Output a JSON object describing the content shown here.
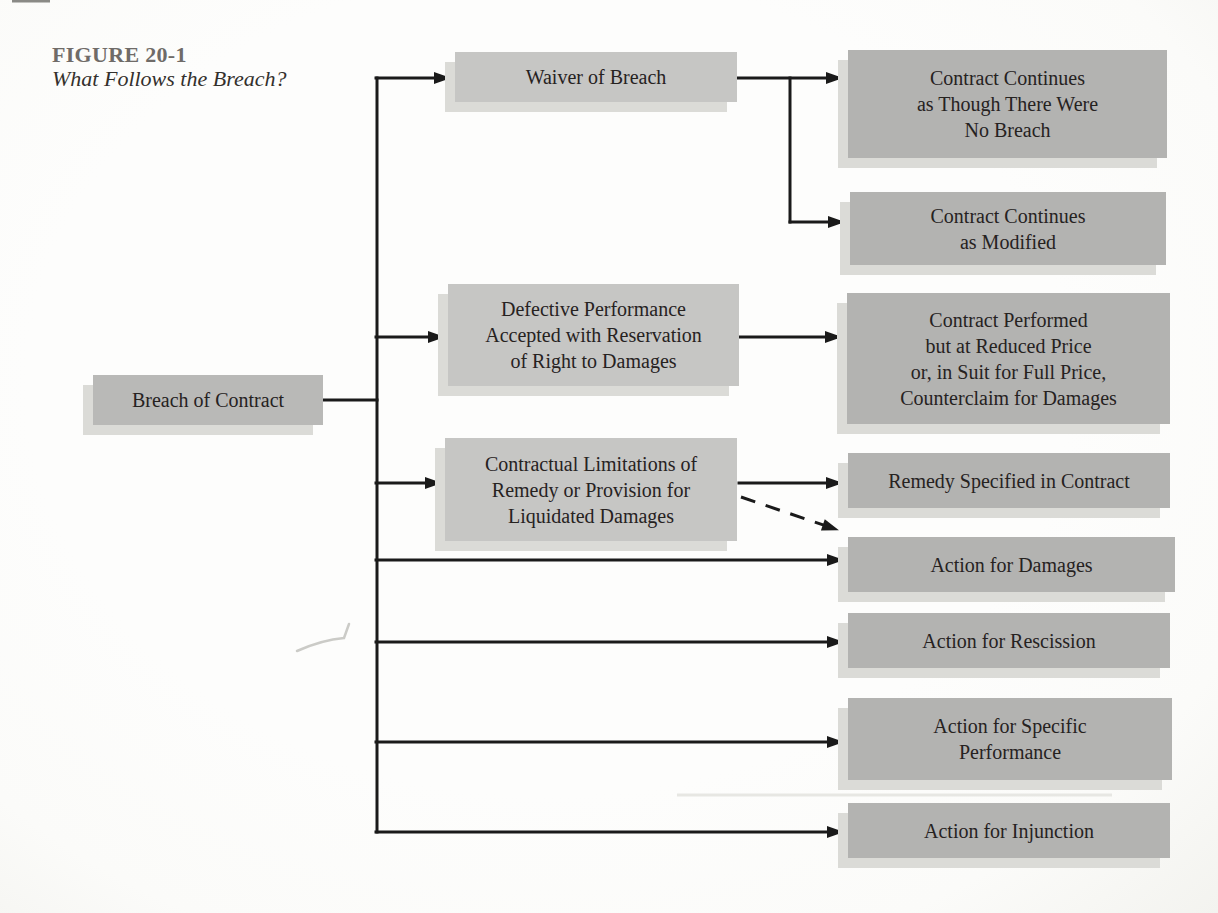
{
  "figure": {
    "label": "FIGURE 20-1",
    "caption": "What Follows the Breach?"
  },
  "colors": {
    "background": "#fbfbf9",
    "line": "#1a1a1a",
    "text": "#26221f",
    "figure_label_color": "#6f6b68",
    "figure_caption_color": "#33302c",
    "box_left_fill": "#b9b9b7",
    "box_mid_fill": "#c6c6c4",
    "box_right_fill": "#b3b3b1",
    "shadow": "#dbdbd7"
  },
  "nodes": {
    "breach": {
      "label": "Breach of Contract"
    },
    "waiver": {
      "label": "Waiver of Breach"
    },
    "defective": {
      "label": "Defective Performance\nAccepted with Reservation\nof Right to Damages"
    },
    "contractual": {
      "label": "Contractual Limitations of\nRemedy or Provision for\nLiquidated Damages"
    },
    "continues_no_breach": {
      "label": "Contract Continues\nas Though There Were\nNo Breach"
    },
    "continues_modified": {
      "label": "Contract Continues\nas Modified"
    },
    "performed_reduced": {
      "label": "Contract Performed\nbut at Reduced Price\nor, in Suit for Full Price,\nCounterclaim for Damages"
    },
    "remedy_specified": {
      "label": "Remedy Specified in Contract"
    },
    "action_damages": {
      "label": "Action for Damages"
    },
    "action_rescission": {
      "label": "Action for Rescission"
    },
    "action_specific": {
      "label": "Action for Specific\nPerformance"
    },
    "action_injunction": {
      "label": "Action for Injunction"
    }
  },
  "edges": [
    {
      "from": "breach",
      "to": "waiver",
      "style": "solid"
    },
    {
      "from": "breach",
      "to": "defective",
      "style": "solid"
    },
    {
      "from": "breach",
      "to": "contractual",
      "style": "solid"
    },
    {
      "from": "breach",
      "to": "action_damages",
      "style": "solid"
    },
    {
      "from": "breach",
      "to": "action_rescission",
      "style": "solid"
    },
    {
      "from": "breach",
      "to": "action_specific",
      "style": "solid"
    },
    {
      "from": "breach",
      "to": "action_injunction",
      "style": "solid"
    },
    {
      "from": "waiver",
      "to": "continues_no_breach",
      "style": "solid"
    },
    {
      "from": "waiver",
      "to": "continues_modified",
      "style": "solid"
    },
    {
      "from": "defective",
      "to": "performed_reduced",
      "style": "solid"
    },
    {
      "from": "contractual",
      "to": "remedy_specified",
      "style": "solid"
    },
    {
      "from": "contractual",
      "to": "action_damages",
      "style": "dashed"
    }
  ]
}
